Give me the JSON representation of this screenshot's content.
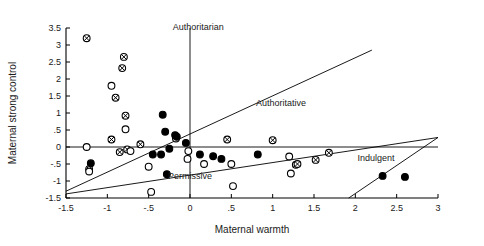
{
  "chart_data": {
    "type": "scatter",
    "title": "",
    "xlabel": "Maternal warmth",
    "ylabel": "Maternal strong control",
    "xlim": [
      -1.5,
      3
    ],
    "ylim": [
      -1.5,
      3.5
    ],
    "xticks": [
      -1.5,
      -1,
      -0.5,
      0,
      0.5,
      1,
      1.5,
      2,
      2.5,
      3
    ],
    "xticklabels": [
      "-1.5",
      "-1",
      "-.5",
      "0",
      ".5",
      "1",
      "1.5",
      "2",
      "2.5",
      "3"
    ],
    "yticks": [
      -1.5,
      -1,
      -0.5,
      0,
      0.5,
      1,
      1.5,
      2,
      2.5,
      3,
      3.5
    ],
    "yticklabels": [
      "-1.5",
      "-1",
      "-.5",
      "0",
      ".5",
      "1",
      "1.5",
      "2",
      "2.5",
      "3",
      "3.5"
    ],
    "grid": false,
    "legend_position": "none",
    "marker_styles": {
      "crossed": "circle-with-cross",
      "open": "open-circle",
      "filled": "filled-circle"
    },
    "series": [
      {
        "name": "crossed",
        "marker": "crossed",
        "points": [
          [
            -1.25,
            3.2
          ],
          [
            -0.8,
            2.65
          ],
          [
            -0.82,
            2.32
          ],
          [
            -0.78,
            0.92
          ],
          [
            -0.9,
            1.45
          ],
          [
            -1.22,
            -0.65
          ],
          [
            -0.95,
            0.22
          ],
          [
            -0.85,
            -0.15
          ],
          [
            -0.76,
            -0.07
          ],
          [
            -0.6,
            0.08
          ],
          [
            0.45,
            0.22
          ],
          [
            1.0,
            0.2
          ],
          [
            1.28,
            -0.52
          ],
          [
            1.3,
            -0.5
          ],
          [
            1.52,
            -0.38
          ],
          [
            1.68,
            -0.17
          ]
        ]
      },
      {
        "name": "open",
        "marker": "open",
        "points": [
          [
            -0.95,
            1.8
          ],
          [
            -1.25,
            0.0
          ],
          [
            -1.22,
            -0.72
          ],
          [
            -0.78,
            0.52
          ],
          [
            -0.72,
            -0.12
          ],
          [
            -0.5,
            -0.58
          ],
          [
            -0.47,
            -1.32
          ],
          [
            -0.17,
            0.25
          ],
          [
            -0.02,
            -0.12
          ],
          [
            -0.03,
            -0.35
          ],
          [
            0.5,
            -0.5
          ],
          [
            0.52,
            -1.15
          ],
          [
            1.2,
            -0.28
          ],
          [
            1.22,
            -0.78
          ],
          [
            0.17,
            -0.5
          ]
        ]
      },
      {
        "name": "filled",
        "marker": "filled",
        "points": [
          [
            -0.33,
            0.95
          ],
          [
            -1.2,
            -0.48
          ],
          [
            -0.3,
            0.45
          ],
          [
            -0.18,
            0.35
          ],
          [
            -0.16,
            0.3
          ],
          [
            -0.05,
            0.12
          ],
          [
            -0.25,
            -0.05
          ],
          [
            -0.35,
            -0.22
          ],
          [
            -0.45,
            -0.22
          ],
          [
            -0.28,
            -0.8
          ],
          [
            0.12,
            -0.22
          ],
          [
            0.28,
            -0.27
          ],
          [
            0.38,
            -0.35
          ],
          [
            0.82,
            -0.22
          ],
          [
            2.33,
            -0.85
          ],
          [
            2.6,
            -0.88
          ]
        ]
      }
    ],
    "reference_lines": [
      {
        "name": "vertical-zero",
        "type": "vertical",
        "x": 0
      },
      {
        "name": "horizontal-zero",
        "type": "horizontal",
        "y": 0
      },
      {
        "name": "authoritative-upper-diagonal",
        "type": "segment",
        "from": [
          -1.5,
          -1.3
        ],
        "to": [
          2.2,
          2.85
        ]
      },
      {
        "name": "permissive-lower-diagonal",
        "type": "segment",
        "from": [
          -1.5,
          -1.38
        ],
        "to": [
          3.0,
          0.28
        ]
      },
      {
        "name": "indulgent-diagonal",
        "type": "segment",
        "from": [
          1.92,
          -1.5
        ],
        "to": [
          3.0,
          0.28
        ]
      }
    ],
    "annotations": [
      {
        "name": "authoritarian-label",
        "text": "Authoritarian",
        "x": 0.1,
        "y": 3.45
      },
      {
        "name": "authoritative-label",
        "text": "Authoritative",
        "x": 1.1,
        "y": 1.22
      },
      {
        "name": "permissive-label",
        "text": "Permissive",
        "x": 0.0,
        "y": -0.95
      },
      {
        "name": "indulgent-label",
        "text": "Indulgent",
        "x": 2.25,
        "y": -0.42
      }
    ]
  }
}
